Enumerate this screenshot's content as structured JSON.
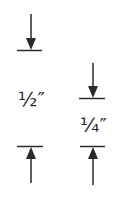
{
  "diagram": {
    "type": "dimension-callouts",
    "stroke_color": "#2a2a2a",
    "dimensions": [
      {
        "id": "half-inch",
        "label": "½″",
        "value_inches": 0.5,
        "top_line_y": 50,
        "bottom_line_y": 146
      },
      {
        "id": "quarter-inch",
        "label": "¼″",
        "value_inches": 0.25,
        "top_line_y": 98,
        "bottom_line_y": 146
      }
    ]
  }
}
